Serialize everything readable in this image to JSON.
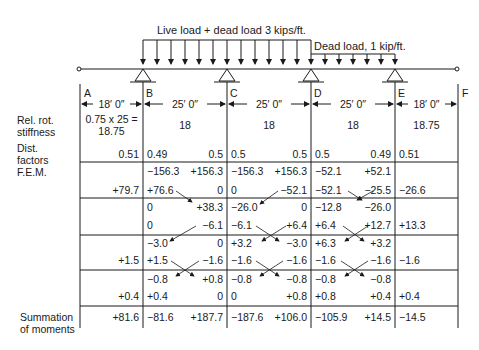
{
  "loads": {
    "live_label": "Live load + dead load 3 kips/ft.",
    "dead_label": "Dead load, 1 kip/ft."
  },
  "supports": [
    "A",
    "B",
    "C",
    "D",
    "E",
    "F"
  ],
  "spans": [
    {
      "from": "A",
      "to": "B",
      "length": "18′ 0″"
    },
    {
      "from": "B",
      "to": "C",
      "length": "25′ 0″"
    },
    {
      "from": "C",
      "to": "D",
      "length": "25′ 0″"
    },
    {
      "from": "D",
      "to": "E",
      "length": "25′ 0″"
    },
    {
      "from": "E",
      "to": "F",
      "length": "18′ 0″"
    }
  ],
  "row_labels": {
    "stiffness_1": "Rel. rot.",
    "stiffness_2": "stiffness",
    "dist_1": "Dist.",
    "dist_2": "factors",
    "fem": "F.E.M.",
    "sum_1": "Summation",
    "sum_2": "of moments"
  },
  "stiffness": {
    "AB_line1": "0.75 x 25 =",
    "AB_line2": "18.75",
    "BC": "18",
    "CD": "18",
    "DE": "18",
    "EF": "18.75"
  },
  "dist_factors": {
    "AB_right": "0.51",
    "BC_left": "0.49",
    "BC_right": "0.5",
    "CD_left": "0.5",
    "CD_right": "0.5",
    "DE_left": "0.5",
    "DE_right": "0.49",
    "EF_left": "0.51"
  },
  "rows": {
    "fem": {
      "AB_r": "",
      "BC_l": "−156.3",
      "BC_r": "+156.3",
      "CD_l": "−156.3",
      "CD_r": "+156.3",
      "DE_l": "−52.1",
      "DE_r": "+52.1",
      "EF_l": ""
    },
    "bal1": {
      "AB_r": "+79.7",
      "BC_l": "+76.6",
      "BC_r": "0",
      "CD_l": "0",
      "CD_r": "−52.1",
      "DE_l": "−52.1",
      "DE_r": "−25.5",
      "EF_l": "−26.6"
    },
    "co1": {
      "AB_r": "",
      "BC_l": "0",
      "BC_r": "+38.3",
      "CD_l": "−26.0",
      "CD_r": "0",
      "DE_l": "−12.8",
      "DE_r": "−26.0",
      "EF_l": ""
    },
    "bal2": {
      "AB_r": "",
      "BC_l": "0",
      "BC_r": "−6.1",
      "CD_l": "−6.1",
      "CD_r": "+6.4",
      "DE_l": "+6.4",
      "DE_r": "+12.7",
      "EF_l": "+13.3"
    },
    "co2": {
      "AB_r": "",
      "BC_l": "−3.0",
      "BC_r": "0",
      "CD_l": "+3.2",
      "CD_r": "−3.0",
      "DE_l": "+6.3",
      "DE_r": "+3.2",
      "EF_l": ""
    },
    "bal3": {
      "AB_r": "+1.5",
      "BC_l": "+1.5",
      "BC_r": "−1.6",
      "CD_l": "−1.6",
      "CD_r": "−1.6",
      "DE_l": "−1.6",
      "DE_r": "−1.6",
      "EF_l": "−1.6"
    },
    "co3": {
      "AB_r": "",
      "BC_l": "−0.8",
      "BC_r": "+0.8",
      "CD_l": "−0.8",
      "CD_r": "−0.8",
      "DE_l": "−0.8",
      "DE_r": "−0.8",
      "EF_l": ""
    },
    "bal4": {
      "AB_r": "+0.4",
      "BC_l": "+0.4",
      "BC_r": "0",
      "CD_l": "0",
      "CD_r": "+0.8",
      "DE_l": "+0.8",
      "DE_r": "+0.4",
      "EF_l": "+0.4"
    },
    "sum": {
      "AB_r": "+81.6",
      "BC_l": "−81.6",
      "BC_r": "+187.7",
      "CD_l": "−187.6",
      "CD_r": "+106.0",
      "DE_l": "−105.9",
      "DE_r": "+14.5",
      "EF_l": "−14.5"
    }
  }
}
